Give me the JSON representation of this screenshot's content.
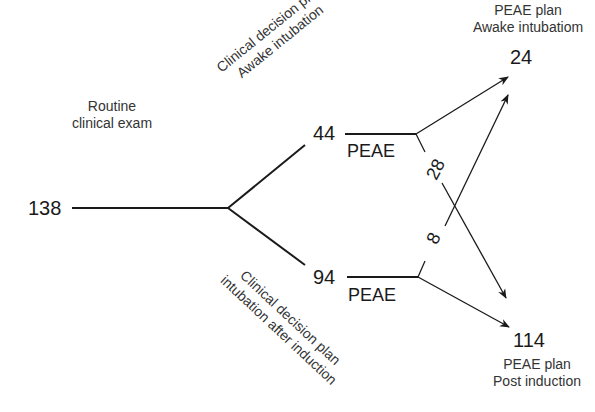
{
  "diagram": {
    "root": {
      "count": "138",
      "label_line1": "Routine",
      "label_line2": "clinical exam"
    },
    "branch_awake": {
      "count": "44",
      "label_line1": "Clinical decision plan",
      "label_line2": "Awake intubation",
      "peae": "PEAE"
    },
    "branch_induction": {
      "count": "94",
      "label_line1": "Clinical decision plan",
      "label_line2": "intubation after induction",
      "peae": "PEAE"
    },
    "cross_awake_to_post": "28",
    "cross_induction_to_awake": "8",
    "outcome_awake": {
      "count": "24",
      "label_line1": "PEAE plan",
      "label_line2": "Awake intubatiom"
    },
    "outcome_post": {
      "count": "114",
      "label_line1": "PEAE plan",
      "label_line2": "Post induction"
    }
  }
}
